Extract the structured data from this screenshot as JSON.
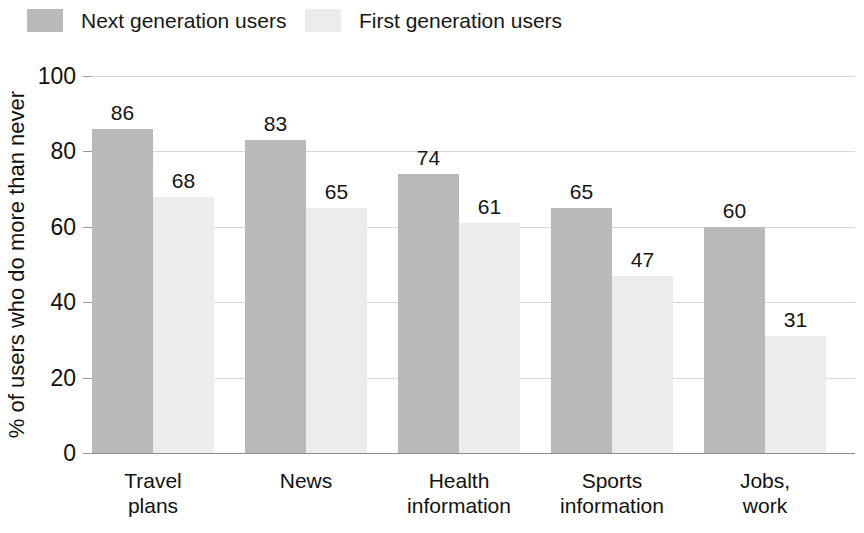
{
  "chart_data": {
    "type": "bar",
    "title": "",
    "xlabel": "",
    "ylabel": "% of users who do more than never",
    "ylim": [
      0,
      100
    ],
    "yticks": [
      0,
      20,
      40,
      60,
      80,
      100
    ],
    "ytick_labels": [
      "0",
      "20",
      "40",
      "60",
      "80",
      "100"
    ],
    "grid": true,
    "legend_position": "top-left",
    "categories": [
      "Travel\nplans",
      "News",
      "Health\ninformation",
      "Sports\ninformation",
      "Jobs,\nwork"
    ],
    "category_lines": [
      [
        "Travel",
        "plans"
      ],
      [
        "News",
        ""
      ],
      [
        "Health",
        "information"
      ],
      [
        "Sports",
        "information"
      ],
      [
        "Jobs,",
        "work"
      ]
    ],
    "series": [
      {
        "name": "Next generation users",
        "color": "#b9b9b9",
        "values": [
          86,
          83,
          74,
          65,
          60
        ],
        "value_labels": [
          "86",
          "83",
          "74",
          "65",
          "60"
        ]
      },
      {
        "name": "First generation users",
        "color": "#ececec",
        "values": [
          68,
          65,
          61,
          47,
          31
        ],
        "value_labels": [
          "68",
          "65",
          "61",
          "47",
          "31"
        ]
      }
    ]
  },
  "legend": {
    "items": [
      {
        "label": "Next generation users",
        "color": "#b9b9b9"
      },
      {
        "label": "First generation users",
        "color": "#ececec"
      }
    ]
  },
  "colors": {
    "next_generation": "#b9b9b9",
    "first_generation": "#ececec",
    "gridline": "#d8d8d8",
    "axis": "#8d8d8d",
    "text": "#141414",
    "background": "#ffffff"
  }
}
